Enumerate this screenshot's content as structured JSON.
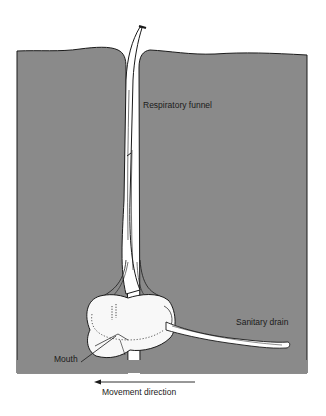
{
  "figure": {
    "background": "#ffffff",
    "soil_color": "#8a8a8a",
    "line_color": "#1a1a1a",
    "organ_fill": "#f8f8f8"
  },
  "labels": {
    "respiratory_funnel": "Respiratory funnel",
    "sanitary_drain": "Sanitary drain",
    "mouth": "Mouth",
    "movement_direction": "Movement direction"
  }
}
